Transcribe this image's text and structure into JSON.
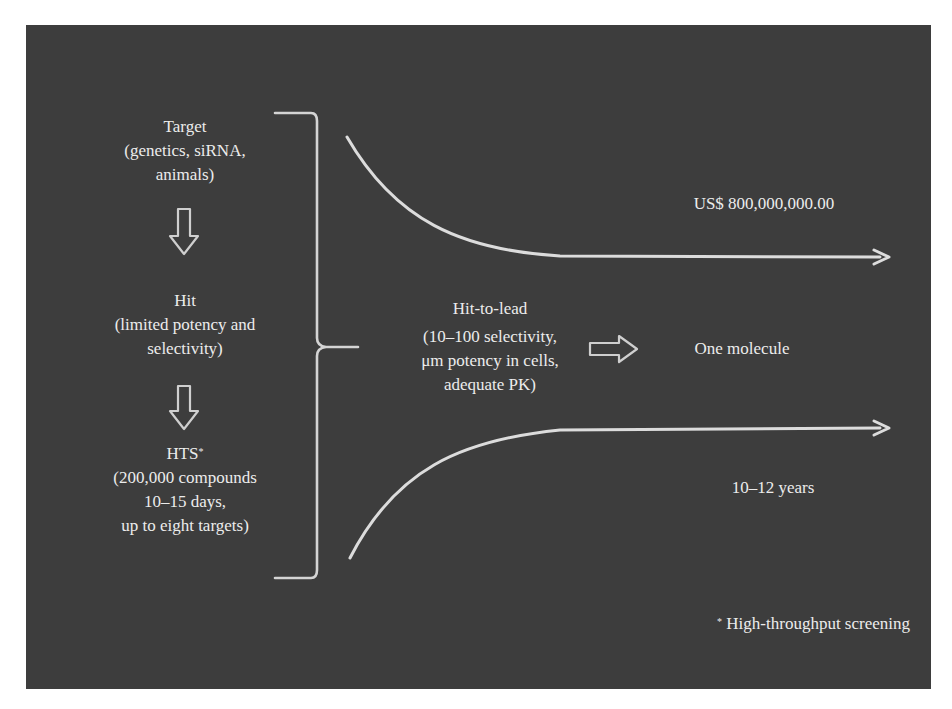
{
  "diagram": {
    "colors": {
      "background": "#3d3d3d",
      "page": "#ffffff",
      "foreground": "#ececec"
    },
    "stages": [
      {
        "title": "Target",
        "details": [
          "(genetics, siRNA,",
          "animals)"
        ]
      },
      {
        "title": "Hit",
        "details": [
          "(limited potency and",
          "selectivity)"
        ]
      },
      {
        "title": "HTS",
        "title_marker": "*",
        "details": [
          "(200,000 compounds",
          "10–15 days,",
          "up to eight targets)"
        ]
      }
    ],
    "stage_arrows": [
      "down-arrow",
      "down-arrow"
    ],
    "bracket": "right-curly-brace",
    "center": {
      "title": "Hit-to-lead",
      "details": [
        "(10–100 selectivity,",
        "μm potency in cells,",
        "adequate PK)"
      ]
    },
    "result_arrow": "right-arrow",
    "result": "One molecule",
    "top_curve_label": "US$ 800,000,000.00",
    "bottom_curve_label": "10–12 years",
    "footnote": {
      "marker": "*",
      "text": "High-throughput screening"
    }
  }
}
